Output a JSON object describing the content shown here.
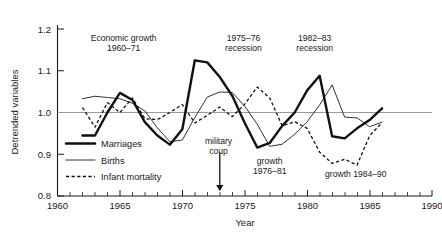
{
  "chart_data": {
    "type": "line",
    "title": "",
    "xlabel": "Year",
    "ylabel": "Detrended variables",
    "xlim": [
      1960,
      1990
    ],
    "ylim": [
      0.8,
      1.2
    ],
    "xticks": [
      1960,
      1965,
      1970,
      1975,
      1980,
      1985,
      1990
    ],
    "xtick_labels": [
      "1960",
      "1965",
      "1970",
      "1975",
      "1980",
      "1985",
      "1990"
    ],
    "xminor_step": 1,
    "yticks": [
      0.8,
      0.9,
      1.0,
      1.1,
      1.2
    ],
    "ytick_labels": [
      "0.8",
      "0.9",
      "1.0",
      "1.1",
      "1.2"
    ],
    "grid": "horizontal gridline at y = 1.0 only",
    "legend_position": "inside lower-left of plot area",
    "x": [
      1962,
      1963,
      1964,
      1965,
      1966,
      1967,
      1968,
      1969,
      1970,
      1971,
      1972,
      1973,
      1974,
      1975,
      1976,
      1977,
      1978,
      1979,
      1980,
      1981,
      1982,
      1983,
      1984,
      1985,
      1986
    ],
    "series": [
      {
        "name": "Marriages",
        "style": "thick-solid",
        "color": "#111111",
        "values": [
          0.945,
          0.945,
          1.0,
          1.047,
          1.03,
          0.977,
          0.945,
          0.923,
          0.96,
          1.125,
          1.12,
          1.085,
          1.04,
          0.975,
          0.916,
          0.927,
          0.968,
          1.0,
          1.053,
          1.088,
          0.943,
          0.938,
          0.962,
          0.982,
          1.01
        ]
      },
      {
        "name": "Births",
        "style": "thin-solid",
        "color": "#333333",
        "values": [
          1.033,
          1.039,
          1.036,
          1.033,
          1.022,
          1.004,
          0.963,
          0.93,
          0.934,
          0.988,
          1.037,
          1.049,
          1.048,
          1.015,
          0.972,
          0.919,
          0.924,
          0.948,
          0.978,
          1.018,
          1.066,
          0.989,
          0.987,
          0.966,
          0.977
        ]
      },
      {
        "name": "Infant mortality",
        "style": "dashed",
        "color": "#111111",
        "values": [
          1.012,
          0.965,
          1.024,
          1.0,
          1.035,
          0.985,
          0.983,
          1.0,
          1.019,
          0.975,
          0.993,
          1.013,
          0.99,
          1.02,
          1.061,
          1.035,
          0.968,
          0.978,
          0.962,
          0.905,
          0.878,
          0.888,
          0.874,
          0.944,
          0.976
        ]
      }
    ],
    "annotations": [
      {
        "id": "economic-growth",
        "text_line1": "Economic growth",
        "text_line2": "1960–71",
        "x": 1965.3,
        "y": 1.172
      },
      {
        "id": "recession-1975-76",
        "text_line1": "1975–76",
        "text_line2": "recession",
        "x": 1974.9,
        "y": 1.172
      },
      {
        "id": "recession-1982-83",
        "text_line1": "1982–83",
        "text_line2": "recession",
        "x": 1980.6,
        "y": 1.172
      },
      {
        "id": "military-coup",
        "text_line1": "military",
        "text_line2": "coup",
        "x": 1972.9,
        "y": 0.925
      },
      {
        "id": "growth-1976-81",
        "text_line1": "growth",
        "text_line2": "1976–81",
        "x": 1977.0,
        "y": 0.877
      },
      {
        "id": "growth-1984-90",
        "text_line1": "growth 1984–90",
        "text_line2": "",
        "x": 1983.9,
        "y": 0.845
      }
    ],
    "arrow": {
      "label": "military-coup-arrow",
      "x": 1973,
      "y_from": 0.905,
      "y_to": 0.812
    }
  },
  "legend": {
    "items": [
      {
        "label": "Marriages",
        "style": "thick-solid"
      },
      {
        "label": "Births",
        "style": "thin-solid"
      },
      {
        "label": "Infant mortality",
        "style": "dashed"
      }
    ]
  },
  "axes": {
    "y_title": "Detrended variables",
    "x_title": "Year"
  }
}
